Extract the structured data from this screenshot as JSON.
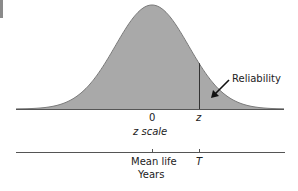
{
  "figure": {
    "annotation": "Reliability",
    "z_axis": {
      "ticks": [
        {
          "label": "0",
          "x": 152
        },
        {
          "label": "z",
          "x": 199
        }
      ],
      "title": "z scale"
    },
    "time_axis": {
      "ticks": [
        {
          "label": "Mean life",
          "x": 152
        },
        {
          "label": "T",
          "x": 199
        }
      ],
      "title": "Years"
    },
    "colors": {
      "fill": "#a9a9a9",
      "outline": "#7a7a7a",
      "axis": "#555555",
      "text": "#222222"
    },
    "curve": {
      "type": "normal-distribution",
      "mean_x": 152,
      "sigma_px": 36.7,
      "baseline_y": 109,
      "peak_y": 5
    }
  }
}
